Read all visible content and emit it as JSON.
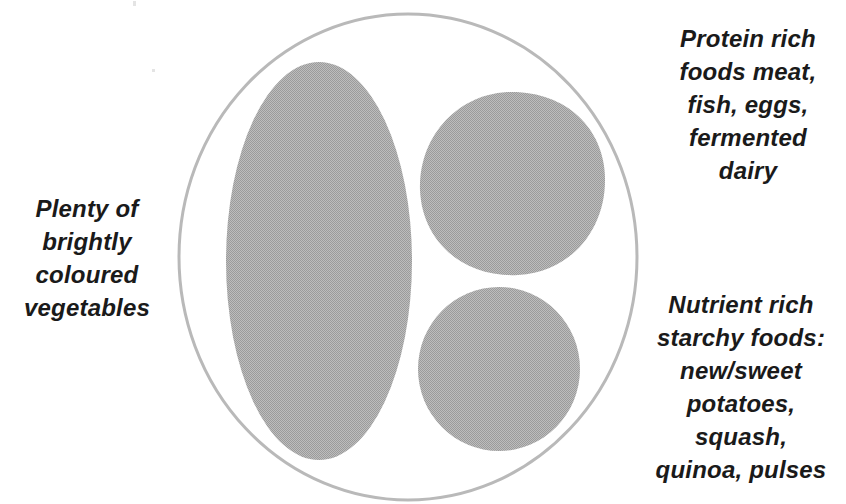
{
  "diagram": {
    "plate": {
      "shape_name": "plate-circle",
      "outline_color": "#b9b9b9",
      "fill_color": "#ffffff",
      "stroke_width": 3
    },
    "portions": [
      {
        "id": "vegetables",
        "shape_name": "vegetables-portion",
        "shape": "tall-ellipse",
        "fill_color": "#adadad",
        "position": "left",
        "share_label": "about half the plate"
      },
      {
        "id": "protein",
        "shape_name": "protein-portion",
        "shape": "rounded-blob",
        "fill_color": "#adadad",
        "position": "upper-right",
        "share_label": "about a quarter of the plate"
      },
      {
        "id": "starchy",
        "shape_name": "starchy-portion",
        "shape": "circle",
        "fill_color": "#adadad",
        "position": "lower-right",
        "share_label": "about a quarter of the plate"
      }
    ]
  },
  "labels": {
    "vegetables": "Plenty of\nbrightly\ncoloured\nvegetables",
    "protein": "Protein rich\nfoods meat,\nfish, eggs,\nfermented\ndairy",
    "starchy": "Nutrient rich\nstarchy foods:\nnew/sweet\npotatoes,\nsquash,\nquinoa, pulses"
  },
  "colors": {
    "text": "#1a1a1a",
    "portion_fill": "#adadad",
    "plate_outline": "#b9b9b9",
    "background": "#ffffff"
  }
}
